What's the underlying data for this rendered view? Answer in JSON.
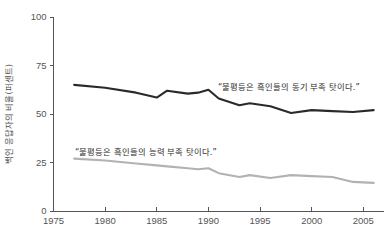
{
  "chart_data": {
    "type": "line",
    "title": "",
    "subtitle": "",
    "xlabel": "",
    "ylabel": "백인 응답자의 비율(퍼센트)",
    "xlim": [
      1975,
      2007
    ],
    "ylim": [
      0,
      100
    ],
    "grid": false,
    "legend_position": "inline-annotations",
    "xticks": [
      "1975",
      "1980",
      "1985",
      "1990",
      "1995",
      "2000",
      "2005"
    ],
    "xtick_values": [
      1975,
      1980,
      1985,
      1990,
      1995,
      2000,
      2005
    ],
    "yticks": [
      "0",
      "25",
      "50",
      "75",
      "100"
    ],
    "ytick_values": [
      0,
      25,
      50,
      75,
      100
    ],
    "series": [
      {
        "name": "“불평등은 흑인들의 동기 부족 탓이다.”",
        "color": "#2a2a2a",
        "width": 2.1,
        "x": [
          1977,
          1980,
          1983,
          1985,
          1986,
          1988,
          1989,
          1990,
          1991,
          1993,
          1994,
          1996,
          1998,
          2000,
          2002,
          2004,
          2006
        ],
        "values": [
          65,
          63.5,
          61,
          58.5,
          62,
          60.5,
          61,
          62.5,
          58,
          54.5,
          55.5,
          54,
          50.5,
          52,
          51.5,
          51,
          52
        ]
      },
      {
        "name": "“불평등은 흑인들의 능력 부족 탓이다.”",
        "color": "#b2b2b2",
        "width": 2.1,
        "x": [
          1977,
          1980,
          1983,
          1985,
          1986,
          1988,
          1989,
          1990,
          1991,
          1993,
          1994,
          1996,
          1998,
          2000,
          2002,
          2004,
          2006
        ],
        "values": [
          27,
          26,
          24.5,
          23.5,
          23,
          22,
          21.5,
          22,
          19.5,
          17.5,
          18.5,
          17,
          18.5,
          18,
          17.5,
          15,
          14.5
        ]
      }
    ],
    "annotations": [
      {
        "text": "“불평등은 흑인들의 동기 부족 탓이다.”",
        "x_px": 218,
        "y_px": 90
      },
      {
        "text": "“불평등은 흑인들의 능력 부족 탓이다.”",
        "x_px": 75,
        "y_px": 155
      }
    ]
  },
  "axes": {
    "y_axis_title": "백인 응답자의 비율(퍼센트)"
  }
}
